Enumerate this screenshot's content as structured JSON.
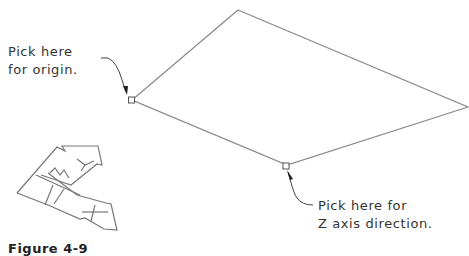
{
  "diagram": {
    "labels": {
      "origin_line1": "Pick here",
      "origin_line2": "for origin.",
      "zaxis_line1": "Pick here for",
      "zaxis_line2": "Z axis direction."
    },
    "caption": "Figure 4-9",
    "shapes": {
      "plane_outline": {
        "points": [
          [
            238,
            10
          ],
          [
            468,
            107
          ],
          [
            287,
            165
          ],
          [
            132,
            100
          ]
        ],
        "stroke": "#8a8a8a"
      },
      "origin_pick_point": {
        "x": 132,
        "y": 100
      },
      "zaxis_pick_point": {
        "x": 286,
        "y": 166
      },
      "ucs_icon": {
        "axes": [
          "X",
          "Y"
        ]
      }
    },
    "colors": {
      "line": "#8a8a8a",
      "text": "#333333",
      "background": "#ffffff"
    }
  }
}
